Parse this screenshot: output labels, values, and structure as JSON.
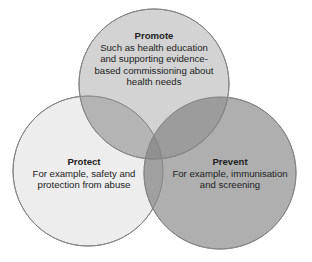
{
  "diagram": {
    "type": "venn",
    "colors": {
      "promote_fill": "#c6c6c6",
      "protect_fill": "#ededed",
      "prevent_fill": "#afafaf",
      "stroke": "#858585",
      "text": "#222222"
    },
    "circles": [
      {
        "id": "promote",
        "title": "Promote",
        "description": "Such as health education and supporting evidence-based commissioning about health needs",
        "lines": [
          "Such as health education",
          "and supporting evidence-",
          "based commissioning about",
          "health needs"
        ]
      },
      {
        "id": "protect",
        "title": "Protect",
        "description": "For example, safety and protection from abuse",
        "lines": [
          "For example, safety and",
          "protection from abuse"
        ]
      },
      {
        "id": "prevent",
        "title": "Prevent",
        "description": "For example, immunisation and screening",
        "lines": [
          "For example, immunisation",
          "and screening"
        ]
      }
    ]
  }
}
